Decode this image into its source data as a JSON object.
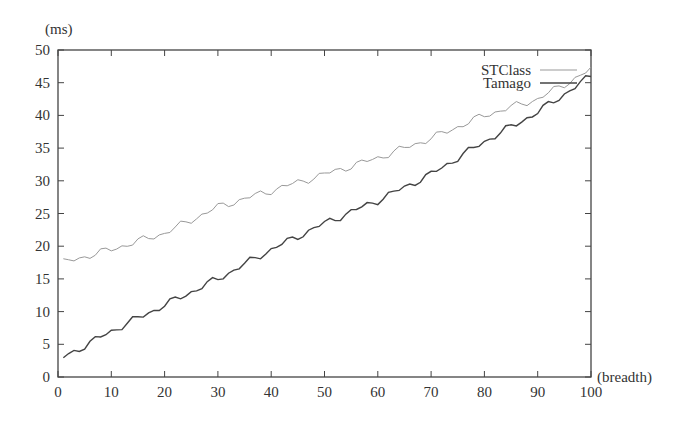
{
  "chart_data": {
    "type": "line",
    "title": "",
    "xlabel": "(breadth)",
    "ylabel": "(ms)",
    "xlim": [
      0,
      100
    ],
    "ylim": [
      0,
      50
    ],
    "x_ticks": [
      0,
      10,
      20,
      30,
      40,
      50,
      60,
      70,
      80,
      90,
      100
    ],
    "y_ticks": [
      0,
      5,
      10,
      15,
      20,
      25,
      30,
      35,
      40,
      45,
      50
    ],
    "legend_position": "top-right",
    "x": [
      1,
      10,
      20,
      30,
      40,
      50,
      60,
      70,
      80,
      90,
      100
    ],
    "series": [
      {
        "name": "STClass",
        "color": "#999999",
        "values": [
          17.5,
          19.5,
          22,
          26,
          28.5,
          31,
          33.5,
          36.5,
          40,
          42.5,
          47
        ]
      },
      {
        "name": "Tamago",
        "color": "#444444",
        "values": [
          3,
          7,
          11,
          15,
          19.5,
          23.5,
          27,
          31,
          36,
          40.5,
          46
        ]
      }
    ]
  }
}
